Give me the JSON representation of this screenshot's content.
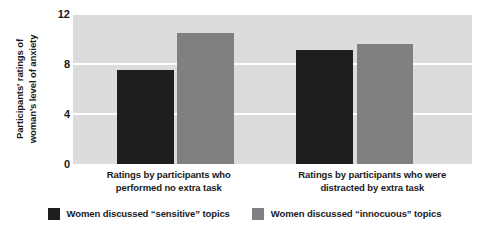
{
  "chart_data": {
    "type": "bar",
    "title": "",
    "xlabel": "",
    "ylabel_lines": [
      "Participants' ratings of",
      "woman's level of anxiety"
    ],
    "ylabel": "Participants' ratings of woman's level of anxiety",
    "ylim": [
      0,
      12
    ],
    "yticks": [
      0,
      4,
      8,
      12
    ],
    "ytick_labels": [
      "0",
      "4",
      "8",
      "12"
    ],
    "grid": true,
    "gridlines_at": [
      4,
      8,
      12
    ],
    "legend_position": "bottom",
    "categories": [
      "Ratings by participants who performed no extra task",
      "Ratings by participants who were distracted by extra task"
    ],
    "category_lines": [
      [
        "Ratings by participants who",
        "performed no extra task"
      ],
      [
        "Ratings by participants who were",
        "distracted by extra task"
      ]
    ],
    "series": [
      {
        "name": "Women discussed “sensitive” topics",
        "color": "#1e1e1e",
        "values": [
          7.5,
          9.1
        ]
      },
      {
        "name": "Women discussed “innocuous” topics",
        "color": "#808080",
        "values": [
          10.5,
          9.6
        ]
      }
    ]
  },
  "colors": {
    "plot_background": "#dcdcdc",
    "gridline": "#ffffff",
    "page_background": "#ffffff",
    "text": "#1a1a1a",
    "series_sensitive": "#1e1e1e",
    "series_innocuous": "#808080"
  },
  "axis": {
    "ytick_0": "0",
    "ytick_1": "4",
    "ytick_2": "8",
    "ytick_3": "12"
  },
  "ylabel": {
    "line0": "Participants' ratings of",
    "line1": "woman's level of anxiety"
  },
  "xlabels": {
    "group0_line0": "Ratings by participants who",
    "group0_line1": "performed no extra task",
    "group1_line0": "Ratings by participants who were",
    "group1_line1": "distracted by extra task"
  },
  "legend": {
    "items": [
      {
        "label": "Women discussed “sensitive” topics",
        "color": "#1e1e1e"
      },
      {
        "label": "Women discussed “innocuous” topics",
        "color": "#808080"
      }
    ]
  }
}
